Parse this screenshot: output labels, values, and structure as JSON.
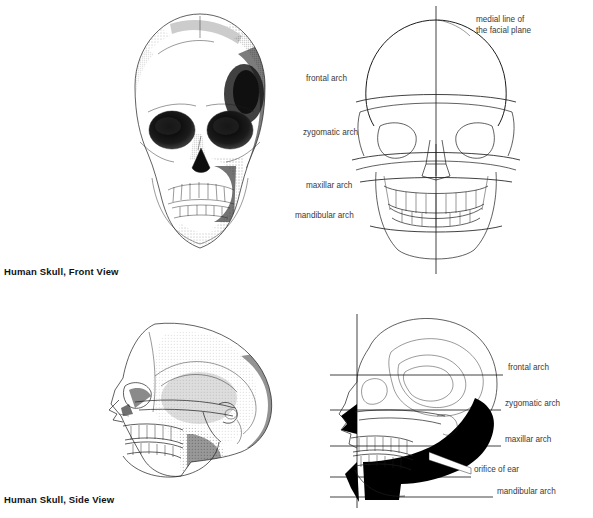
{
  "page": {
    "background": "#ffffff",
    "ink_color": "#1c1c1c",
    "label_color": "#3a3a3a",
    "width": 593,
    "height": 518
  },
  "captions": [
    {
      "id": "front-view-caption",
      "text": "Human Skull, Front View",
      "x": 4,
      "y": 266
    },
    {
      "id": "side-view-caption",
      "text": "Human Skull, Side View",
      "x": 4,
      "y": 494
    }
  ],
  "panels": [
    {
      "id": "front-rendering",
      "kind": "stipple-drawing",
      "view": "front",
      "x": 118,
      "y": 8,
      "w": 165,
      "h": 255
    },
    {
      "id": "front-schematic",
      "kind": "line-diagram",
      "view": "front",
      "x": 366,
      "y": 8,
      "w": 165,
      "h": 262
    },
    {
      "id": "side-rendering",
      "kind": "stipple-drawing",
      "view": "side",
      "x": 95,
      "y": 318,
      "w": 205,
      "h": 172
    },
    {
      "id": "side-schematic",
      "kind": "line-diagram",
      "view": "side",
      "x": 330,
      "y": 318,
      "w": 180,
      "h": 185
    }
  ],
  "front_schematic": {
    "medial_line_label": {
      "line1": "medial line of",
      "line2": "the facial plane",
      "x": 476,
      "y": 14
    },
    "arch_labels": [
      {
        "name": "frontal arch",
        "text": "frontal arch",
        "x": 306,
        "y": 73,
        "anchor_y": 96
      },
      {
        "name": "zygomatic arch",
        "text": "zygomatic arch",
        "x": 303,
        "y": 127,
        "anchor_y": 150
      },
      {
        "name": "maxillar arch",
        "text": "maxillar arch",
        "x": 306,
        "y": 180,
        "anchor_y": 190
      },
      {
        "name": "mandibular arch",
        "text": "mandibular arch",
        "x": 295,
        "y": 210,
        "anchor_y": 222
      }
    ]
  },
  "side_schematic": {
    "labels": [
      {
        "name": "frontal arch",
        "text": "frontal arch",
        "x": 508,
        "y": 362,
        "line_y": 375
      },
      {
        "name": "zygomatic arch",
        "text": "zygomatic arch",
        "x": 505,
        "y": 398,
        "line_y": 410
      },
      {
        "name": "maxillar arch",
        "text": "maxillar arch",
        "x": 505,
        "y": 434,
        "line_y": 446
      },
      {
        "name": "orifice of ear",
        "text": "orifice of ear",
        "x": 474,
        "y": 464,
        "line_y": 477
      },
      {
        "name": "mandibular arch",
        "text": "mandibular arch",
        "x": 497,
        "y": 486,
        "line_y": 497
      }
    ]
  }
}
